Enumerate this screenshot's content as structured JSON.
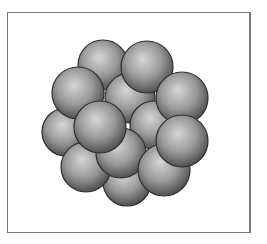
{
  "diagram": {
    "frame": {
      "x": 7,
      "y": 12,
      "width": 244,
      "height": 221,
      "stroke": "#777777"
    },
    "sphere_style": {
      "highlight": "#d6d6d6",
      "mid": "#9a9a9a",
      "shadow": "#4a4a4a",
      "outline": "#2e2e2e"
    },
    "spheres": [
      {
        "id": "top-left-back",
        "cx": 103,
        "cy": 65,
        "r": 25
      },
      {
        "id": "center-back",
        "cx": 130,
        "cy": 98,
        "r": 25
      },
      {
        "id": "left-middle-back",
        "cx": 66,
        "cy": 132,
        "r": 24
      },
      {
        "id": "bottom",
        "cx": 127,
        "cy": 182,
        "r": 24
      },
      {
        "id": "top-right",
        "cx": 147,
        "cy": 67,
        "r": 26
      },
      {
        "id": "left-upper",
        "cx": 78,
        "cy": 93,
        "r": 26
      },
      {
        "id": "lower-left",
        "cx": 86,
        "cy": 167,
        "r": 25
      },
      {
        "id": "center-right",
        "cx": 154,
        "cy": 125,
        "r": 24
      },
      {
        "id": "lower-center",
        "cx": 121,
        "cy": 153,
        "r": 25
      },
      {
        "id": "lower-right",
        "cx": 164,
        "cy": 170,
        "r": 26
      },
      {
        "id": "right-upper",
        "cx": 182,
        "cy": 98,
        "r": 26
      },
      {
        "id": "center-left-front",
        "cx": 100,
        "cy": 127,
        "r": 26
      },
      {
        "id": "right-front",
        "cx": 182,
        "cy": 141,
        "r": 26
      }
    ]
  }
}
